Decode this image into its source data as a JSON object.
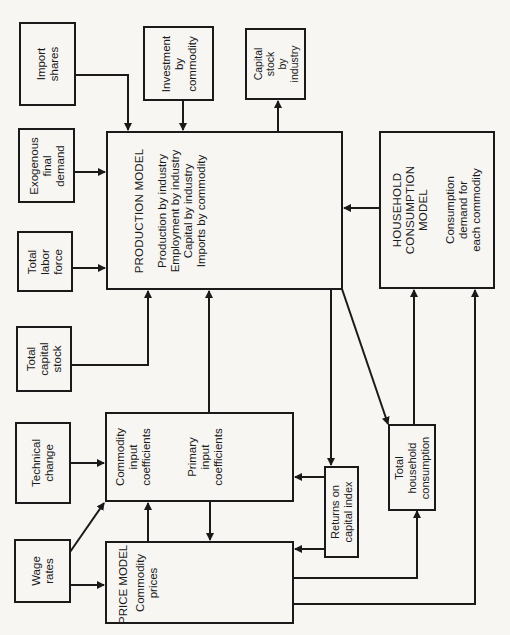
{
  "diagram": {
    "boxes": {
      "import_shares": {
        "lines": [
          "Import",
          "shares"
        ]
      },
      "investment_by_commodity": {
        "lines": [
          "Investment",
          "by",
          "commodity"
        ]
      },
      "capital_stock_by_industry": {
        "lines": [
          "Capital",
          "stock",
          "by",
          "industry"
        ]
      },
      "exogenous_final_demand": {
        "lines": [
          "Exogenous",
          "final",
          "demand"
        ]
      },
      "total_labor_force": {
        "lines": [
          "Total",
          "labor",
          "force"
        ]
      },
      "total_capital_stock": {
        "lines": [
          "Total",
          "capital",
          "stock"
        ]
      },
      "technical_change": {
        "lines": [
          "Technical",
          "change"
        ]
      },
      "wage_rates": {
        "lines": [
          "Wage",
          "rates"
        ]
      },
      "production_model": {
        "title": "PRODUCTION MODEL",
        "lines": [
          "Production by industry",
          "Employment by industry",
          "Capital by industry",
          "Imports by commodity"
        ]
      },
      "household_consumption_model": {
        "title_lines": [
          "HOUSEHOLD",
          "CONSUMPTION",
          "MODEL"
        ],
        "lines": [
          "Consumption",
          "demand for",
          "each commodity"
        ]
      },
      "coefficients": {
        "commodity_lines": [
          "Commodity",
          "input",
          "coefficients"
        ],
        "primary_lines": [
          "Primary",
          "input",
          "coefficients"
        ]
      },
      "price_model": {
        "title": "PRICE MODEL",
        "lines": [
          "Commodity",
          "prices"
        ]
      },
      "returns_on_capital_index": {
        "lines": [
          "Returns on",
          "capital index"
        ]
      },
      "total_household_consumption": {
        "lines": [
          "Total",
          "household",
          "consumption"
        ]
      }
    },
    "edges": [
      {
        "from": "Import shares",
        "to": "Production model"
      },
      {
        "from": "Investment by commodity",
        "to": "Production model"
      },
      {
        "from": "Production model",
        "to": "Capital stock by industry"
      },
      {
        "from": "Exogenous final demand",
        "to": "Production model"
      },
      {
        "from": "Total labor force",
        "to": "Production model"
      },
      {
        "from": "Total capital stock",
        "to": "Production model"
      },
      {
        "from": "Household consumption model",
        "to": "Production model"
      },
      {
        "from": "Coefficients",
        "to": "Production model"
      },
      {
        "from": "Technical change",
        "to": "Coefficients"
      },
      {
        "from": "Wage rates",
        "to": "Coefficients"
      },
      {
        "from": "Wage rates",
        "to": "Price model"
      },
      {
        "from": "Price model",
        "to": "Coefficients"
      },
      {
        "from": "Coefficients",
        "to": "Price model"
      },
      {
        "from": "Production model",
        "to": "Returns on capital index"
      },
      {
        "from": "Returns on capital index",
        "to": "Coefficients"
      },
      {
        "from": "Returns on capital index",
        "to": "Price model"
      },
      {
        "from": "Production model",
        "to": "Total household consumption"
      },
      {
        "from": "Total household consumption",
        "to": "Household consumption model"
      },
      {
        "from": "Price model",
        "to": "Total household consumption"
      },
      {
        "from": "Price model",
        "to": "Household consumption model"
      }
    ],
    "colors": {
      "ink": "#1a1a1a",
      "paper": "#f7f6f3"
    }
  }
}
